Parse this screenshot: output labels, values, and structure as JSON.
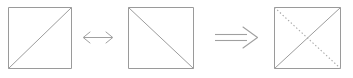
{
  "figure": {
    "background_color": "#ffffff",
    "width": 353,
    "height": 78,
    "stroke_color_square": "#9a9a9a",
    "stroke_color_diagonal_solid": "#9c9c9c",
    "stroke_color_diagonal_dotted": "#a8a8a8",
    "stroke_color_arrow": "#a0a0a0",
    "stroke_width": 1
  },
  "elements": [
    {
      "id": "square-1",
      "kind": "square",
      "label": "Square with rising diagonal",
      "x": 8,
      "y": 7,
      "width": 63,
      "height": 61,
      "diagonals": [
        {
          "direction": "bottom-left-to-top-right",
          "style": "solid"
        }
      ]
    },
    {
      "id": "arrow-1",
      "kind": "arrow",
      "label": "Left-right double headed arrow",
      "glyph": "left-right-arrow",
      "symbol": "↔",
      "x": 82,
      "y": 37,
      "length": 32,
      "heads": "both",
      "lines": 1
    },
    {
      "id": "square-2",
      "kind": "square",
      "label": "Square with falling diagonal",
      "x": 128,
      "y": 7,
      "width": 65,
      "height": 61,
      "diagonals": [
        {
          "direction": "top-left-to-bottom-right",
          "style": "solid"
        }
      ]
    },
    {
      "id": "arrow-2",
      "kind": "arrow",
      "label": "Rightwards double arrow implies",
      "glyph": "rightwards-double-arrow",
      "symbol": "⟹",
      "x": 214,
      "y": 37,
      "length": 44,
      "heads": "right",
      "lines": 2
    },
    {
      "id": "square-3",
      "kind": "square",
      "label": "Square with both diagonals superimposed",
      "x": 274,
      "y": 7,
      "width": 66,
      "height": 61,
      "diagonals": [
        {
          "direction": "bottom-left-to-top-right",
          "style": "solid"
        },
        {
          "direction": "top-left-to-bottom-right",
          "style": "dotted"
        }
      ]
    }
  ],
  "accessibility": {
    "description": "A square containing a diagonal from bottom-left to top-right, a double headed arrow, a square containing a diagonal from top-left to bottom-right, a double rightwards arrow, and a square containing both diagonals where the falling diagonal is drawn dotted."
  }
}
